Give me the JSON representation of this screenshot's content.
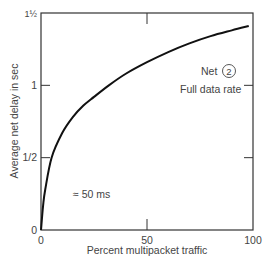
{
  "chart_data": {
    "type": "line",
    "title": "",
    "xlabel": "Percent multipacket traffic",
    "ylabel": "Average net delay in sec",
    "xlim": [
      0,
      100
    ],
    "ylim": [
      0,
      1.5
    ],
    "x_ticks": [
      {
        "value": 0,
        "label": "0"
      },
      {
        "value": 50,
        "label": "50"
      },
      {
        "value": 100,
        "label": "100"
      }
    ],
    "y_ticks": [
      {
        "value": 0,
        "label": "0"
      },
      {
        "value": 0.5,
        "label": "1/2"
      },
      {
        "value": 1,
        "label": "1"
      },
      {
        "value": 1.5,
        "label": "1½"
      }
    ],
    "grid": false,
    "series": [
      {
        "name": "Net 2 Full data rate",
        "x": [
          0,
          1,
          2,
          5,
          10,
          15,
          20,
          25,
          32,
          40,
          50,
          60,
          70,
          80,
          90,
          98
        ],
        "y": [
          0,
          0.17,
          0.28,
          0.5,
          0.67,
          0.78,
          0.86,
          0.92,
          1.0,
          1.08,
          1.16,
          1.23,
          1.29,
          1.34,
          1.38,
          1.41
        ]
      }
    ],
    "annotations": [
      {
        "text": "Net",
        "circled": "2",
        "x": 88,
        "y": 1.1
      },
      {
        "text": "Full data rate",
        "x": 85,
        "y": 0.98
      },
      {
        "text": "≈ 50 ms",
        "x": 16,
        "y": 0.24
      }
    ]
  },
  "labels": {
    "net": "Net",
    "net_number": "2",
    "full_data_rate": "Full data rate",
    "approx_50ms": "≈ 50 ms"
  }
}
